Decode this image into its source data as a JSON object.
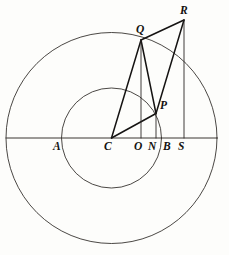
{
  "figure": {
    "kind": "geometric-diagram",
    "title": "",
    "caption": "",
    "background_color": "#fdfdfb",
    "ink_color": "#141210"
  },
  "geometry": {
    "center": {
      "label": "C",
      "x": 111.5,
      "y": 138
    },
    "outer_circle": {
      "cx": 111.5,
      "cy": 138,
      "r": 105.5
    },
    "inner_circle": {
      "cx": 111.5,
      "cy": 138,
      "r": 50
    },
    "axis": {
      "x1": 6,
      "y1": 138,
      "x2": 217,
      "y2": 138
    }
  },
  "points": [
    {
      "name": "A",
      "label": "A",
      "x": 61,
      "y": 138,
      "label_x": 53,
      "label_y": 141
    },
    {
      "name": "C",
      "label": "C",
      "x": 111.5,
      "y": 138,
      "label_x": 104,
      "label_y": 141
    },
    {
      "name": "O",
      "label": "O",
      "x": 141,
      "y": 138,
      "label_x": 134,
      "label_y": 141
    },
    {
      "name": "N",
      "label": "N",
      "x": 156,
      "y": 138,
      "label_x": 148,
      "label_y": 141
    },
    {
      "name": "B",
      "label": "B",
      "x": 170,
      "y": 138,
      "label_x": 163,
      "label_y": 141
    },
    {
      "name": "S",
      "label": "S",
      "x": 184,
      "y": 138,
      "label_x": 178,
      "label_y": 141
    },
    {
      "name": "P",
      "label": "P",
      "x": 156,
      "y": 113.5,
      "label_x": 160,
      "label_y": 100
    },
    {
      "name": "Q",
      "label": "Q",
      "x": 141,
      "y": 40,
      "label_x": 136,
      "label_y": 24
    },
    {
      "name": "R",
      "label": "R",
      "x": 184,
      "y": 20,
      "label_x": 180,
      "label_y": 5
    }
  ],
  "segments": [
    {
      "name": "segment-C-Q",
      "from": "C",
      "to": "Q",
      "weight": "heavy"
    },
    {
      "name": "segment-C-P",
      "from": "C",
      "to": "P",
      "weight": "heavy"
    },
    {
      "name": "segment-Q-R",
      "from": "Q",
      "to": "R",
      "weight": "heavy"
    },
    {
      "name": "segment-Q-P",
      "from": "Q",
      "to": "P",
      "weight": "heavy"
    },
    {
      "name": "segment-P-R",
      "from": "P",
      "to": "R",
      "weight": "heavy"
    },
    {
      "name": "drop-Q-O",
      "from": "Q",
      "to": "O",
      "weight": "light"
    },
    {
      "name": "drop-P-N",
      "from": "P",
      "to": "N",
      "weight": "light"
    },
    {
      "name": "drop-R-S",
      "from": "R",
      "to": "S",
      "weight": "light"
    }
  ],
  "labels": {
    "A": "A",
    "C": "C",
    "O": "O",
    "N": "N",
    "B": "B",
    "S": "S",
    "P": "P",
    "Q": "Q",
    "R": "R"
  }
}
